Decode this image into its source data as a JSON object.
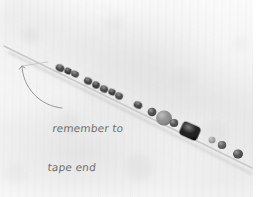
{
  "image": {
    "kind": "photograph",
    "subject": "beaded-string-strand",
    "width": 261,
    "height": 197,
    "background_color": "#f5f5f5",
    "page_margin_color": "#ffffff"
  },
  "annotation": {
    "line_1": "remember to",
    "line_2": "tape end",
    "text_color": "#6e6e6e",
    "arrow": {
      "name": "curved-arrow-to-string-end",
      "from_x": 62,
      "from_y": 108,
      "to_x": 22,
      "to_y": 66,
      "color": "#8c8c8c"
    }
  },
  "strand": {
    "string_color": "#c9c9c9",
    "start_x": 4,
    "start_y": 46,
    "end_x": 252,
    "end_y": 168,
    "free_end_x": 22,
    "free_end_y": 66,
    "beads": [
      {
        "name": "bead-1",
        "cx": 60,
        "cy": 68,
        "rx": 4.5,
        "ry": 3.6,
        "color": "#3d3d3d",
        "shape": "oval",
        "rot": 26
      },
      {
        "name": "bead-2",
        "cx": 68,
        "cy": 71,
        "rx": 3.6,
        "ry": 3.2,
        "color": "#2e2e2e",
        "shape": "round",
        "rot": 26
      },
      {
        "name": "bead-3",
        "cx": 75,
        "cy": 74,
        "rx": 4.0,
        "ry": 3.2,
        "color": "#474747",
        "shape": "oval",
        "rot": 26
      },
      {
        "name": "bead-4",
        "cx": 88,
        "cy": 81,
        "rx": 4.2,
        "ry": 3.4,
        "color": "#3a3a3a",
        "shape": "oval",
        "rot": 26
      },
      {
        "name": "bead-5",
        "cx": 96,
        "cy": 85,
        "rx": 3.8,
        "ry": 3.4,
        "color": "#303030",
        "shape": "round",
        "rot": 26
      },
      {
        "name": "bead-6",
        "cx": 104,
        "cy": 89,
        "rx": 4.2,
        "ry": 3.6,
        "color": "#3f3f3f",
        "shape": "round",
        "rot": 26
      },
      {
        "name": "bead-7",
        "cx": 112,
        "cy": 92,
        "rx": 3.6,
        "ry": 3.2,
        "color": "#353535",
        "shape": "round",
        "rot": 26
      },
      {
        "name": "bead-8",
        "cx": 119,
        "cy": 96,
        "rx": 4.0,
        "ry": 3.4,
        "color": "#434343",
        "shape": "round",
        "rot": 26
      },
      {
        "name": "bead-9",
        "cx": 138,
        "cy": 105,
        "rx": 4.4,
        "ry": 3.6,
        "color": "#3b3b3b",
        "shape": "oval",
        "rot": 26
      },
      {
        "name": "bead-10",
        "cx": 152,
        "cy": 112,
        "rx": 4.4,
        "ry": 4.2,
        "color": "#464646",
        "shape": "round",
        "rot": 0
      },
      {
        "name": "bead-11",
        "cx": 164,
        "cy": 118,
        "rx": 8.0,
        "ry": 7.4,
        "color": "#8a8a8a",
        "shape": "round",
        "rot": 0
      },
      {
        "name": "bead-12",
        "cx": 174,
        "cy": 123,
        "rx": 4.2,
        "ry": 4.0,
        "color": "#4a4a4a",
        "shape": "round",
        "rot": 0
      },
      {
        "name": "bead-13",
        "cx": 190,
        "cy": 131,
        "rx": 9.6,
        "ry": 7.2,
        "color": "#141414",
        "shape": "block",
        "rot": 24
      },
      {
        "name": "bead-14",
        "cx": 212,
        "cy": 140,
        "rx": 3.4,
        "ry": 3.2,
        "color": "#9d9d9d",
        "shape": "round",
        "rot": 0
      },
      {
        "name": "bead-15",
        "cx": 222,
        "cy": 145,
        "rx": 4.2,
        "ry": 4.0,
        "color": "#555555",
        "shape": "round",
        "rot": 0
      },
      {
        "name": "bead-16",
        "cx": 238,
        "cy": 154,
        "rx": 5.0,
        "ry": 4.6,
        "color": "#474747",
        "shape": "round",
        "rot": 0
      }
    ]
  }
}
